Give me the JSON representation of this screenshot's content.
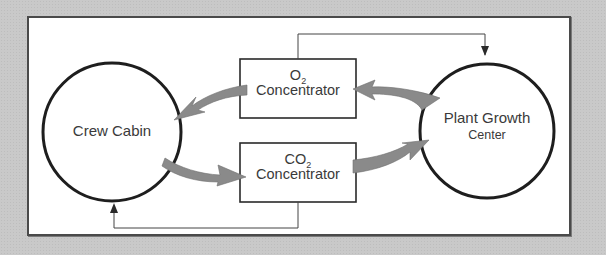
{
  "diagram": {
    "title": "",
    "nodes": [
      {
        "id": "crew_cabin",
        "shape": "circle",
        "label": "Crew Cabin"
      },
      {
        "id": "plant_growth",
        "shape": "circle",
        "label_line1": "Plant Growth",
        "label_line2": "Center"
      },
      {
        "id": "o2_conc",
        "shape": "rect",
        "label_main": "O",
        "label_sub": "2",
        "label_line2": "Concentrator"
      },
      {
        "id": "co2_conc",
        "shape": "rect",
        "label_main": "CO",
        "label_sub": "2",
        "label_line2": "Concentrator"
      }
    ],
    "edges": [
      {
        "from": "plant_growth",
        "to": "o2_conc",
        "style": "thick-curved-gray-arrow"
      },
      {
        "from": "o2_conc",
        "to": "crew_cabin",
        "style": "thick-curved-gray-arrow"
      },
      {
        "from": "crew_cabin",
        "to": "co2_conc",
        "style": "thick-curved-gray-arrow"
      },
      {
        "from": "co2_conc",
        "to": "plant_growth",
        "style": "thick-curved-gray-arrow"
      },
      {
        "from": "o2_conc",
        "to": "plant_growth",
        "style": "thin-elbow-line-arrow"
      },
      {
        "from": "co2_conc",
        "to": "crew_cabin",
        "style": "thin-elbow-line-arrow"
      }
    ],
    "colors": {
      "background": "#c9c9c9",
      "frame": "#ffffff",
      "stroke": "#1e1e1e",
      "flow_arrow": "#8a8a8a",
      "text": "#3a3a3a"
    }
  }
}
